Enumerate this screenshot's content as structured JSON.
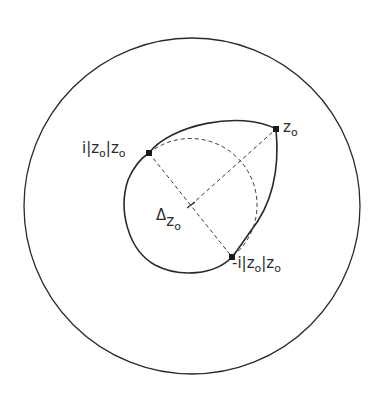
{
  "figure": {
    "colors": {
      "background": "#ffffff",
      "stroke": "#2a2a2a",
      "dashed": "#3a3a3a"
    },
    "outer_circle": {
      "cx": 192,
      "cy": 206,
      "r": 168
    },
    "center": {
      "x": 191,
      "y": 205
    },
    "points": {
      "z0": {
        "x": 276,
        "y": 129
      },
      "plus_i": {
        "x": 149,
        "y": 153
      },
      "minus_i": {
        "x": 232,
        "y": 257
      }
    },
    "labels": {
      "z0": {
        "base": "z",
        "sub": "o"
      },
      "plus_i": {
        "prefix": "i|z",
        "sub1": "o",
        "mid": "|z",
        "sub2": "o"
      },
      "minus_i": {
        "prefix": "-i|z",
        "sub1": "o",
        "mid": "|z",
        "sub2": "o"
      },
      "region": {
        "base": "Δ",
        "sub1": "z",
        "sub2": "o"
      }
    }
  }
}
